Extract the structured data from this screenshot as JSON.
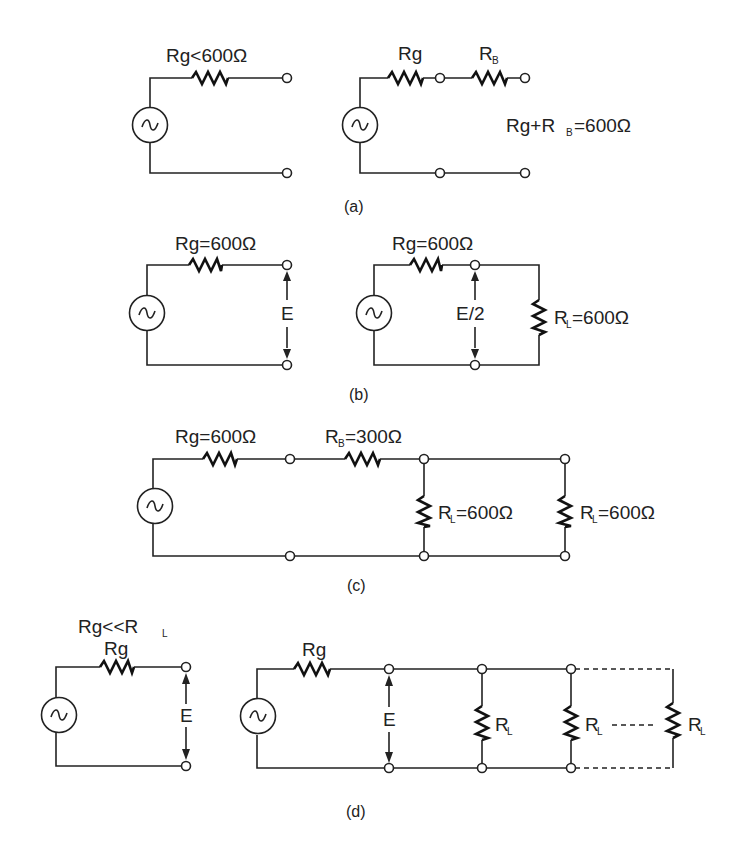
{
  "figure": {
    "panels": [
      {
        "id": "a",
        "caption": "(a)",
        "left": {
          "resistor_label": "Rg<600Ω"
        },
        "right": {
          "resistor1_label": "Rg",
          "resistor2_label_main": "R",
          "resistor2_label_sub": "B",
          "equation_parts": [
            "Rg+R",
            "B",
            "=600Ω"
          ]
        }
      },
      {
        "id": "b",
        "caption": "(b)",
        "left": {
          "resistor_label": "Rg=600Ω",
          "voltage_label": "E"
        },
        "right": {
          "resistor_label": "Rg=600Ω",
          "voltage_label": "E/2",
          "load_label_main": "R",
          "load_label_sub": "L",
          "load_label_value": "=600Ω"
        }
      },
      {
        "id": "c",
        "caption": "(c)",
        "rg_label": "Rg=600Ω",
        "rb_label_main": "R",
        "rb_label_sub": "B",
        "rb_label_value": "=300Ω",
        "load1_label_main": "R",
        "load1_label_sub": "L",
        "load1_label_value": "=600Ω",
        "load2_label_main": "R",
        "load2_label_sub": "L",
        "load2_label_value": "=600Ω"
      },
      {
        "id": "d",
        "caption": "(d)",
        "condition_parts": [
          "Rg<<R",
          "L"
        ],
        "left": {
          "resistor_label": "Rg",
          "voltage_label": "E"
        },
        "right": {
          "resistor_label": "Rg",
          "voltage_label": "E",
          "loads": [
            {
              "main": "R",
              "sub": "L"
            },
            {
              "main": "R",
              "sub": "L"
            },
            {
              "main": "R",
              "sub": "L"
            }
          ]
        }
      }
    ],
    "source_symbol": "~"
  }
}
